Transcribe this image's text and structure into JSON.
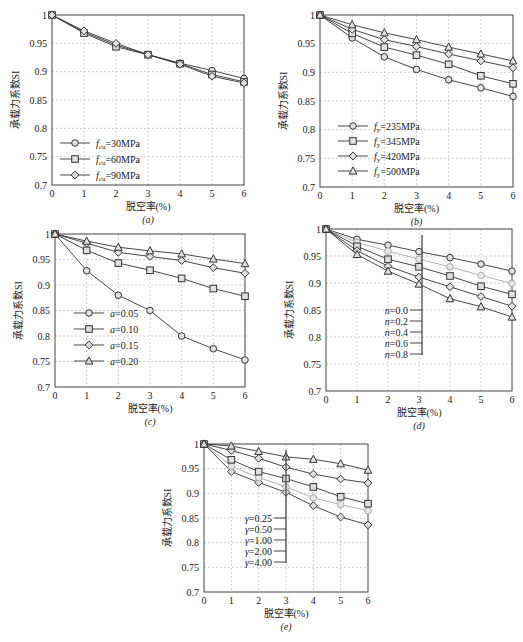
{
  "chart_data": [
    {
      "id": "a",
      "type": "line",
      "caption": "(a)",
      "xlabel": "脱空率(%)",
      "ylabel": "承载力系数SI",
      "x": [
        0,
        1,
        2,
        3,
        4,
        5,
        6
      ],
      "xticks": [
        "0",
        "1",
        "2",
        "3",
        "4",
        "5",
        "6"
      ],
      "yticks": [
        "0.7",
        "0.75",
        "0.8",
        "0.85",
        "0.9",
        "0.95",
        "1"
      ],
      "xlim": [
        0,
        6
      ],
      "ylim": [
        0.7,
        1.0
      ],
      "grid": true,
      "legend_position": "bottom-left",
      "legend_style": "box",
      "series": [
        {
          "name": "fcu=30MPa",
          "label_main": "f",
          "label_sub": "cu",
          "label_rest": "=30MPa",
          "marker": "circle",
          "color": "#333333",
          "values": [
            1.0,
            0.97,
            0.947,
            0.93,
            0.915,
            0.902,
            0.888
          ]
        },
        {
          "name": "fcu=60MPa",
          "label_main": "f",
          "label_sub": "cu",
          "label_rest": "=60MPa",
          "marker": "square",
          "color": "#333333",
          "values": [
            1.0,
            0.968,
            0.944,
            0.93,
            0.914,
            0.895,
            0.882
          ]
        },
        {
          "name": "fcu=90MPa",
          "label_main": "f",
          "label_sub": "cu",
          "label_rest": "=90MPa",
          "marker": "diamond",
          "color": "#333333",
          "values": [
            1.0,
            0.972,
            0.95,
            0.93,
            0.913,
            0.892,
            0.88
          ]
        }
      ]
    },
    {
      "id": "b",
      "type": "line",
      "caption": "(b)",
      "xlabel": "脱空率(%)",
      "ylabel": "承载力系数SI",
      "x": [
        0,
        1,
        2,
        3,
        4,
        5,
        6
      ],
      "xticks": [
        "0",
        "1",
        "2",
        "3",
        "4",
        "5",
        "6"
      ],
      "yticks": [
        "0.7",
        "0.75",
        "0.8",
        "0.85",
        "0.9",
        "0.95",
        "1"
      ],
      "xlim": [
        0,
        6
      ],
      "ylim": [
        0.7,
        1.0
      ],
      "grid": true,
      "legend_position": "bottom-left",
      "legend_style": "box",
      "series": [
        {
          "name": "fy=235MPa",
          "label_main": "f",
          "label_sub": "y",
          "label_rest": "=235MPa",
          "marker": "circle",
          "color": "#333333",
          "values": [
            1.0,
            0.96,
            0.927,
            0.905,
            0.887,
            0.873,
            0.858
          ]
        },
        {
          "name": "fy=345MPa",
          "label_main": "f",
          "label_sub": "y",
          "label_rest": "=345MPa",
          "marker": "square",
          "color": "#333333",
          "values": [
            1.0,
            0.968,
            0.944,
            0.93,
            0.914,
            0.894,
            0.88
          ]
        },
        {
          "name": "fy=420MPa",
          "label_main": "f",
          "label_sub": "y",
          "label_rest": "=420MPa",
          "marker": "diamond",
          "color": "#333333",
          "values": [
            1.0,
            0.975,
            0.957,
            0.945,
            0.932,
            0.92,
            0.908
          ]
        },
        {
          "name": "fy=500MPa",
          "label_main": "f",
          "label_sub": "y",
          "label_rest": "=500MPa",
          "marker": "triangle",
          "color": "#333333",
          "values": [
            1.0,
            0.983,
            0.969,
            0.957,
            0.944,
            0.932,
            0.92
          ]
        }
      ]
    },
    {
      "id": "c",
      "type": "line",
      "caption": "(c)",
      "xlabel": "脱空率(%)",
      "ylabel": "承载力系数SI",
      "x": [
        0,
        1,
        2,
        3,
        4,
        5,
        6
      ],
      "xticks": [
        "0",
        "1",
        "2",
        "3",
        "4",
        "5",
        "6"
      ],
      "yticks": [
        "0.7",
        "0.75",
        "0.8",
        "0.85",
        "0.9",
        "0.95",
        "1"
      ],
      "xlim": [
        0,
        6
      ],
      "ylim": [
        0.7,
        1.0
      ],
      "grid": true,
      "legend_position": "bottom-left",
      "legend_style": "box",
      "series": [
        {
          "name": "a=0.05",
          "label_main": "a",
          "label_sub": "",
          "label_rest": "=0.05",
          "marker": "circle",
          "color": "#333333",
          "values": [
            1.0,
            0.928,
            0.88,
            0.85,
            0.8,
            0.775,
            0.753
          ]
        },
        {
          "name": "a=0.10",
          "label_main": "a",
          "label_sub": "",
          "label_rest": "=0.10",
          "marker": "square",
          "color": "#333333",
          "values": [
            1.0,
            0.968,
            0.943,
            0.929,
            0.913,
            0.893,
            0.878
          ]
        },
        {
          "name": "a=0.15",
          "label_main": "a",
          "label_sub": "",
          "label_rest": "=0.15",
          "marker": "diamond",
          "color": "#333333",
          "values": [
            1.0,
            0.982,
            0.964,
            0.956,
            0.948,
            0.934,
            0.923
          ]
        },
        {
          "name": "a=0.20",
          "label_main": "a",
          "label_sub": "",
          "label_rest": "=0.20",
          "marker": "triangle",
          "color": "#333333",
          "values": [
            1.0,
            0.986,
            0.974,
            0.967,
            0.961,
            0.951,
            0.942
          ]
        }
      ]
    },
    {
      "id": "d",
      "type": "line",
      "caption": "(d)",
      "xlabel": "脱空率(%)",
      "ylabel": "承载力系数SI",
      "x": [
        0,
        1,
        2,
        3,
        4,
        5,
        6
      ],
      "xticks": [
        "0",
        "1",
        "2",
        "3",
        "4",
        "5",
        "6"
      ],
      "yticks": [
        "0.7",
        "0.75",
        "0.8",
        "0.85",
        "0.9",
        "0.95",
        "1"
      ],
      "xlim": [
        0,
        6
      ],
      "ylim": [
        0.7,
        1.0
      ],
      "grid": true,
      "legend_position": "center",
      "legend_style": "bracket",
      "series": [
        {
          "name": "n=0.0",
          "label_main": "n",
          "label_sub": "",
          "label_rest": "=0.0",
          "marker": "circle",
          "color": "#333333",
          "values": [
            1.0,
            0.981,
            0.97,
            0.958,
            0.947,
            0.935,
            0.922
          ]
        },
        {
          "name": "n=0.2",
          "label_main": "n",
          "label_sub": "",
          "label_rest": "=0.2",
          "marker": "circle",
          "color": "#aaaaaa",
          "values": [
            1.0,
            0.975,
            0.959,
            0.944,
            0.93,
            0.914,
            0.899
          ]
        },
        {
          "name": "n=0.4",
          "label_main": "n",
          "label_sub": "",
          "label_rest": "=0.4",
          "marker": "square",
          "color": "#333333",
          "values": [
            1.0,
            0.968,
            0.944,
            0.93,
            0.913,
            0.894,
            0.879
          ]
        },
        {
          "name": "n=0.6",
          "label_main": "n",
          "label_sub": "",
          "label_rest": "=0.6",
          "marker": "diamond",
          "color": "#333333",
          "values": [
            1.0,
            0.96,
            0.931,
            0.911,
            0.893,
            0.875,
            0.857
          ]
        },
        {
          "name": "n=0.8",
          "label_main": "n",
          "label_sub": "",
          "label_rest": "=0.8",
          "marker": "triangle",
          "color": "#333333",
          "values": [
            1.0,
            0.953,
            0.922,
            0.898,
            0.871,
            0.856,
            0.837
          ]
        }
      ]
    },
    {
      "id": "e",
      "type": "line",
      "caption": "(e)",
      "xlabel": "脱空率(%)",
      "ylabel": "承载力系数SI",
      "x": [
        0,
        1,
        2,
        3,
        4,
        5,
        6
      ],
      "xticks": [
        "0",
        "1",
        "2",
        "3",
        "4",
        "5",
        "6"
      ],
      "yticks": [
        "0.7",
        "0.75",
        "0.8",
        "0.85",
        "0.9",
        "0.95",
        "1"
      ],
      "xlim": [
        0,
        6
      ],
      "ylim": [
        0.7,
        1.0
      ],
      "grid": true,
      "legend_position": "center",
      "legend_style": "bracket",
      "series": [
        {
          "name": "γ=0.25",
          "label_main": "γ",
          "label_sub": "",
          "label_rest": "=0.25",
          "marker": "diamond",
          "color": "#333333",
          "values": [
            1.0,
            0.944,
            0.922,
            0.902,
            0.875,
            0.852,
            0.836
          ]
        },
        {
          "name": "γ=0.50",
          "label_main": "γ",
          "label_sub": "",
          "label_rest": "=0.50",
          "marker": "circle",
          "color": "#aaaaaa",
          "values": [
            1.0,
            0.955,
            0.932,
            0.913,
            0.891,
            0.877,
            0.865
          ]
        },
        {
          "name": "γ=1.00",
          "label_main": "γ",
          "label_sub": "",
          "label_rest": "=1.00",
          "marker": "square",
          "color": "#333333",
          "values": [
            1.0,
            0.968,
            0.944,
            0.93,
            0.913,
            0.893,
            0.879
          ]
        },
        {
          "name": "γ=2.00",
          "label_main": "γ",
          "label_sub": "",
          "label_rest": "=2.00",
          "marker": "diamond",
          "color": "#333333",
          "values": [
            1.0,
            0.987,
            0.971,
            0.953,
            0.939,
            0.929,
            0.921
          ]
        },
        {
          "name": "γ=4.00",
          "label_main": "γ",
          "label_sub": "",
          "label_rest": "=4.00",
          "marker": "triangle",
          "color": "#333333",
          "values": [
            1.0,
            0.996,
            0.985,
            0.974,
            0.969,
            0.96,
            0.947
          ]
        }
      ]
    }
  ]
}
